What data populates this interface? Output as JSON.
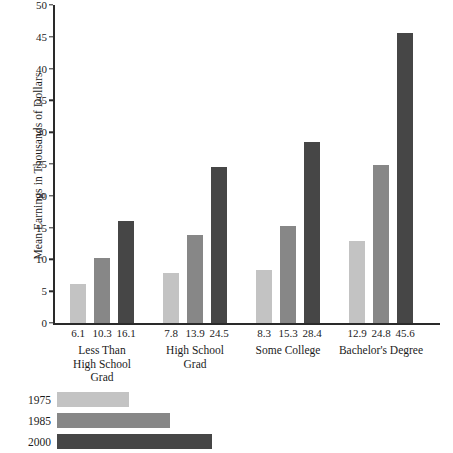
{
  "chart_data": {
    "type": "bar",
    "title": "",
    "xlabel": "",
    "ylabel": "Mean Earnings in Thousands of Dollars",
    "ylim": [
      0,
      50
    ],
    "ytick_step": 5,
    "yticks": [
      "0",
      "5",
      "10",
      "15",
      "20",
      "25",
      "30",
      "35",
      "40",
      "45",
      "50"
    ],
    "grid": false,
    "legend_position": "bottom-left",
    "categories": [
      [
        "Less Than",
        "High School",
        "Grad"
      ],
      [
        "High School",
        "Grad"
      ],
      [
        "Some College"
      ],
      [
        "Bachelor's Degree"
      ]
    ],
    "category_names": [
      "Less Than High School Grad",
      "High School Grad",
      "Some College",
      "Bachelor's Degree"
    ],
    "series": [
      {
        "name": "1975",
        "color": "#c3c3c3",
        "values": [
          6.1,
          7.8,
          8.3,
          12.9
        ],
        "labels": [
          "6.1",
          "7.8",
          "8.3",
          "12.9"
        ]
      },
      {
        "name": "1985",
        "color": "#878787",
        "values": [
          10.3,
          13.9,
          15.3,
          24.8
        ],
        "labels": [
          "10.3",
          "13.9",
          "15.3",
          "24.8"
        ]
      },
      {
        "name": "2000",
        "color": "#464646",
        "values": [
          16.1,
          24.5,
          28.4,
          45.6
        ],
        "labels": [
          "16.1",
          "24.5",
          "28.4",
          "45.6"
        ]
      }
    ],
    "legend": [
      {
        "label": "1975",
        "color": "#c3c3c3",
        "swatch_width": 72
      },
      {
        "label": "1985",
        "color": "#878787",
        "swatch_width": 113
      },
      {
        "label": "2000",
        "color": "#464646",
        "swatch_width": 155
      }
    ],
    "axis_color": "#2a2a2a"
  }
}
